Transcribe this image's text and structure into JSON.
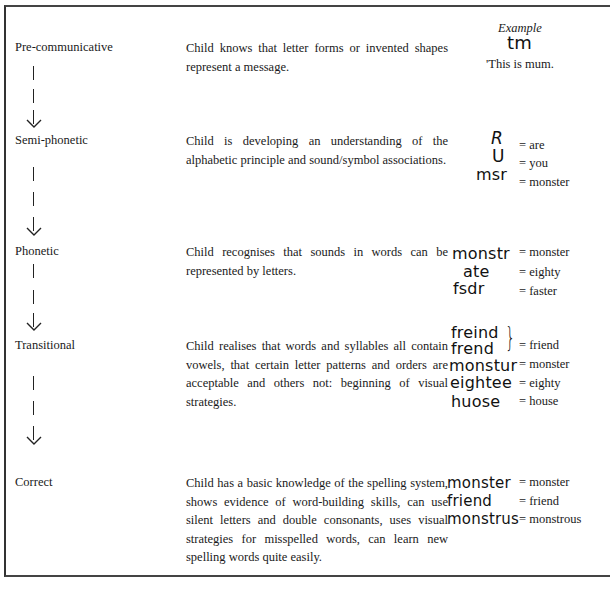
{
  "example_header": "Example",
  "stages": [
    {
      "name": "Pre-communicative",
      "description": "Child knows that letter forms or invented shapes represent a message.",
      "examples_intro": {
        "written": "tm",
        "gloss": "'This is mum."
      }
    },
    {
      "name": "Semi-phonetic",
      "description": "Child is developing an understanding of the alphabetic principle and sound/symbol associations.",
      "examples": [
        {
          "written": "R",
          "gloss": "= are"
        },
        {
          "written": "U",
          "gloss": "= you"
        },
        {
          "written": "msr",
          "gloss": "= monster"
        }
      ]
    },
    {
      "name": "Phonetic",
      "description": "Child recognises that sounds in words can be represented by letters.",
      "examples": [
        {
          "written": "monstr",
          "gloss": "= monster"
        },
        {
          "written": "ate",
          "gloss": "= eighty"
        },
        {
          "written": "fsdr",
          "gloss": "= faster"
        }
      ]
    },
    {
      "name": "Transitional",
      "description": "Child realises that words and syllables all contain vowels, that certain letter patterns and orders are acceptable and others not: beginning of visual strategies.",
      "examples": [
        {
          "written": "freind",
          "gloss": ""
        },
        {
          "written": "frend",
          "gloss": "= friend"
        },
        {
          "written": "monstur",
          "gloss": "= monster"
        },
        {
          "written": "eightee",
          "gloss": "= eighty"
        },
        {
          "written": "huose",
          "gloss": "= house"
        }
      ]
    },
    {
      "name": "Correct",
      "description": "Child has a basic knowledge of the spelling system, shows evidence of word-building skills, can use silent letters and double consonants, uses visual strategies for misspelled words, can learn new spelling words quite easily.",
      "examples": [
        {
          "written": "monster",
          "gloss": "= monster"
        },
        {
          "written": "friend",
          "gloss": "= friend"
        },
        {
          "written": "monstrus",
          "gloss": "= monstrous"
        }
      ]
    }
  ]
}
